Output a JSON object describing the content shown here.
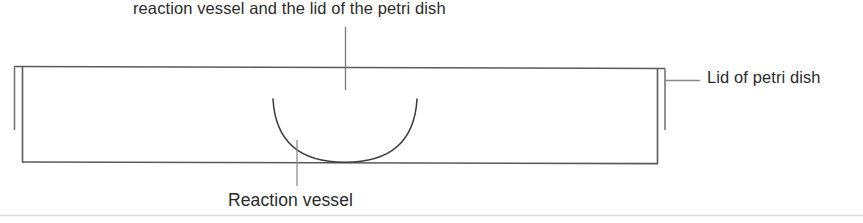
{
  "diagram": {
    "labels": {
      "top": "reaction vessel and the lid of the petri dish",
      "right": "Lid of petri dish",
      "bottom": "Reaction vessel"
    },
    "icons": {
      "petri_dish_lid": "petri-dish-lid-shape",
      "reaction_vessel": "reaction-vessel-parabola-shape",
      "leader_top": "leader-line-vertical",
      "leader_right": "leader-line-horizontal",
      "leader_bottom": "leader-line-vertical",
      "baseline_rule": "horizontal-rule"
    },
    "colors": {
      "stroke": "#555555",
      "stroke_light": "#6a6a6a",
      "text": "#2b2b2b",
      "faint_rule": "#dcdcdc",
      "background": "#ffffff"
    },
    "geometry": {
      "canvas_width": 863,
      "canvas_height": 223,
      "lid_rect": {
        "left": 22,
        "right": 658,
        "top": 67,
        "bottom": 163
      },
      "lid_rim_left_x": 14,
      "lid_rim_right_x": 665,
      "lid_rim_top_y": 66,
      "lid_rim_bottom_y": 130,
      "vessel_left_x": 273,
      "vessel_right_x": 417,
      "vessel_top_y": 99,
      "vessel_vertex_x": 345,
      "vessel_vertex_y": 162,
      "leader_top_x": 345,
      "leader_top_y1": 27,
      "leader_top_y2": 90,
      "leader_bottom_x": 297,
      "leader_bottom_y1": 140,
      "leader_bottom_y2": 186,
      "leader_right_y": 80,
      "leader_right_x1": 665,
      "leader_right_x2": 700,
      "baseline_rule_y": 215
    }
  }
}
